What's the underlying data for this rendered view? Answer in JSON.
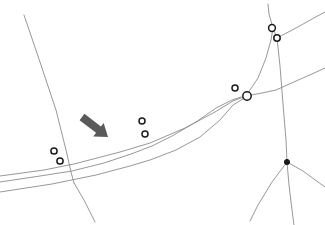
{
  "canvas": {
    "width": 325,
    "height": 225,
    "background": "#ffffff"
  },
  "style": {
    "road_color": "#8c8c8c",
    "road_width": 0.9,
    "node_stroke": "#1a1a1a",
    "node_fill": "#ffffff",
    "node_filled_color": "#1a1a1a",
    "arrow_color": "#5a5a5a"
  },
  "chart_data": {
    "type": "map",
    "title": "",
    "roads": [
      {
        "name": "north-descending-road",
        "points": "24,15 40,62 56,110 66,150 71,172 74,183"
      },
      {
        "name": "upper-main-road",
        "points": "0,176 44,170 74,164 120,152 150,143 185,128 215,112 233,101 246,96"
      },
      {
        "name": "lower-main-road",
        "points": "0,192 52,184 96,175 130,166 150,160 176,150 200,137 220,120 233,105 246,97"
      },
      {
        "name": "highlighted-curve-road",
        "points": "0,182 40,176 72,171 104,163 131,154 152,146 172,136 196,122 216,108 232,100 241,97"
      },
      {
        "name": "southwest-branch",
        "points": "74,183 84,200 95,222"
      },
      {
        "name": "center-junction-to-northeast",
        "points": "246,96 258,78 266,58 271,40 273,28"
      },
      {
        "name": "northeast-vertical-road",
        "points": "273,28 277,38 280,66 283,104 286,140 287,162"
      },
      {
        "name": "northeast-top-spur",
        "points": "273,28 269,14 268,4"
      },
      {
        "name": "northeast-upper-right-road",
        "points": "277,38 296,28 312,19 325,12"
      },
      {
        "name": "east-horizontal-road",
        "points": "246,96 262,93 276,90 296,81 312,74 325,68"
      },
      {
        "name": "southeast-branch-east",
        "points": "287,162 303,171 318,182 325,187"
      },
      {
        "name": "southeast-branch-southwest",
        "points": "287,162 272,182 258,205 250,221"
      },
      {
        "name": "southeast-branch-south",
        "points": "287,162 289,185 292,210 294,225"
      }
    ],
    "nodes": [
      {
        "name": "node-left-upper",
        "x": 54,
        "y": 151,
        "r": 3.1,
        "filled": false
      },
      {
        "name": "node-left-lower",
        "x": 60,
        "y": 161,
        "r": 3.1,
        "filled": false
      },
      {
        "name": "node-center-upper",
        "x": 142,
        "y": 121,
        "r": 3.0,
        "filled": false
      },
      {
        "name": "node-center-lower",
        "x": 145,
        "y": 134,
        "r": 3.0,
        "filled": false
      },
      {
        "name": "node-right-small",
        "x": 235,
        "y": 88,
        "r": 3.0,
        "filled": false
      },
      {
        "name": "node-right-junction",
        "x": 247,
        "y": 96,
        "r": 4.2,
        "filled": false
      },
      {
        "name": "node-topright-upper",
        "x": 272,
        "y": 28,
        "r": 3.4,
        "filled": false
      },
      {
        "name": "node-topright-lower",
        "x": 277,
        "y": 38,
        "r": 3.2,
        "filled": false
      },
      {
        "name": "node-bottomright-filled",
        "x": 287,
        "y": 162,
        "r": 2.6,
        "filled": true
      }
    ],
    "annotations": [
      {
        "name": "pointer-arrow",
        "type": "arrow",
        "from_x": 82,
        "from_y": 117,
        "to_x": 108,
        "to_y": 137,
        "color": "#5a5a5a",
        "shaft_width": 8,
        "head_width": 17,
        "head_length": 12
      }
    ]
  }
}
